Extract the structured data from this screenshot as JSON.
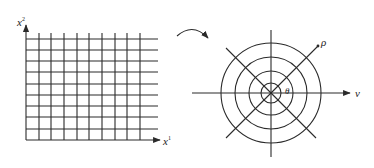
{
  "diagram": {
    "colors": {
      "line": "#2a2a2a",
      "background": "#ffffff"
    },
    "cartesian": {
      "x_axis_label": "x",
      "x_axis_superscript": "1",
      "y_axis_label": "x",
      "y_axis_superscript": "2",
      "vertical_lines_x": [
        39,
        51,
        64,
        77,
        89,
        102,
        115,
        127,
        140
      ],
      "horizontal_lines_y": [
        39,
        50,
        61,
        72,
        84,
        95,
        106,
        117,
        129
      ],
      "origin": [
        26,
        140
      ],
      "grid_top": 33,
      "grid_right": 158
    },
    "transform_arrow": {
      "label": "",
      "icon": "curved-arrow-icon"
    },
    "polar": {
      "center": [
        271,
        93
      ],
      "radii": [
        10,
        22,
        36,
        50
      ],
      "radial_label": "ρ",
      "angle_label": "θ",
      "horizontal_axis_label": "ν"
    }
  }
}
